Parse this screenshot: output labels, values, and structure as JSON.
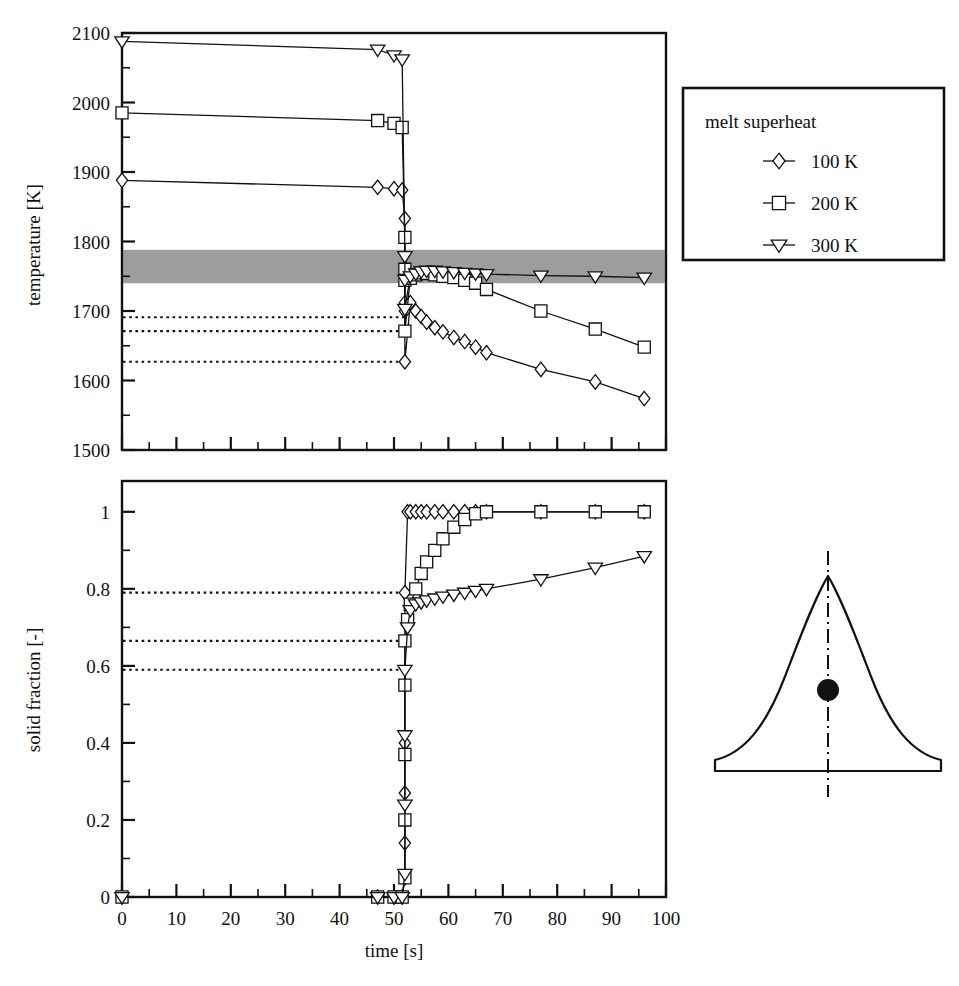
{
  "figure": {
    "background_color": "#ffffff",
    "ink_color": "#111111",
    "band_color": "#9d9d9d"
  },
  "legend": {
    "title": "melt superheat",
    "entries": [
      {
        "marker": "diamond-marker",
        "label": "100 K"
      },
      {
        "marker": "square-marker",
        "label": "200 K"
      },
      {
        "marker": "triangle-down-marker",
        "label": "300 K"
      }
    ]
  },
  "inset": {
    "name": "casting-cross-section-sketch",
    "centerline": "dash-dot-centerline",
    "probe": "thermocouple-location-dot"
  },
  "chart_data": [
    {
      "type": "line",
      "id": "temperature-vs-time",
      "title": "",
      "xlabel": "time  [s]",
      "ylabel": "temperature  [K]",
      "xlim": [
        0,
        100
      ],
      "ylim": [
        1500,
        2100
      ],
      "xticks": [
        0,
        10,
        20,
        30,
        40,
        50,
        60,
        70,
        80,
        90,
        100
      ],
      "xtick_labels": [
        "0",
        "10",
        "20",
        "30",
        "40",
        "50",
        "60",
        "70",
        "80",
        "90",
        "100"
      ],
      "yticks": [
        1500,
        1600,
        1700,
        1800,
        1900,
        2000,
        2100
      ],
      "ytick_labels": [
        "1500",
        "1600",
        "1700",
        "1800",
        "1900",
        "2000",
        "2100"
      ],
      "minor_x_step": 5,
      "minor_y_step": 50,
      "grid": false,
      "legend_position": "outside-right-top",
      "shaded_band": {
        "label": "solidification interval",
        "y_from": 1740,
        "y_to": 1788
      },
      "annotations": [
        {
          "type": "dotted-hline",
          "y": 1691,
          "x_from": 0,
          "x_to": 52,
          "belongs_to": "100 K"
        },
        {
          "type": "dotted-hline",
          "y": 1671,
          "x_from": 0,
          "x_to": 52,
          "belongs_to": "200 K"
        },
        {
          "type": "dotted-hline",
          "y": 1627,
          "x_from": 0,
          "x_to": 52,
          "belongs_to": "300 K"
        }
      ],
      "series": [
        {
          "name": "100 K",
          "marker": "diamond",
          "x": [
            0,
            47,
            50,
            51.5,
            52,
            52,
            52,
            52,
            52,
            53,
            54,
            55,
            56,
            57.5,
            59,
            61,
            63,
            65,
            67,
            77,
            87,
            96
          ],
          "y": [
            1888,
            1878,
            1876,
            1874,
            1833,
            1762,
            1712,
            1700,
            1627,
            1712,
            1700,
            1692,
            1684,
            1676,
            1670,
            1662,
            1656,
            1648,
            1640,
            1616,
            1598,
            1574
          ]
        },
        {
          "name": "200 K",
          "marker": "square",
          "x": [
            0,
            47,
            50,
            51.5,
            52,
            52,
            52,
            52,
            53,
            54,
            55,
            56,
            57.5,
            59,
            61,
            63,
            65,
            67,
            77,
            87,
            96
          ],
          "y": [
            1985,
            1974,
            1970,
            1964,
            1806,
            1760,
            1744,
            1671,
            1747,
            1752,
            1755,
            1754,
            1752,
            1750,
            1748,
            1744,
            1740,
            1731,
            1700,
            1674,
            1648
          ]
        },
        {
          "name": "300 K",
          "marker": "triangle-down",
          "x": [
            0,
            47,
            50,
            51.5,
            52,
            52,
            52,
            53,
            54,
            55,
            56,
            57.5,
            59,
            61,
            63,
            65,
            67,
            77,
            87,
            96
          ],
          "y": [
            2088,
            2076,
            2068,
            2062,
            1779,
            1745,
            1703,
            1750,
            1754,
            1757,
            1758,
            1758,
            1757,
            1756,
            1755,
            1754,
            1753,
            1751,
            1750,
            1748
          ]
        }
      ]
    },
    {
      "type": "line",
      "id": "solid-fraction-vs-time",
      "title": "",
      "xlabel": "time  [s]",
      "ylabel": "solid fraction [-]",
      "xlim": [
        0,
        100
      ],
      "ylim": [
        0,
        1.08
      ],
      "xticks": [
        0,
        10,
        20,
        30,
        40,
        50,
        60,
        70,
        80,
        90,
        100
      ],
      "xtick_labels": [
        "0",
        "10",
        "20",
        "30",
        "40",
        "50",
        "60",
        "70",
        "80",
        "90",
        "100"
      ],
      "yticks": [
        0,
        0.2,
        0.4,
        0.6,
        0.8,
        1
      ],
      "ytick_labels": [
        "0",
        "0.2",
        "0.4",
        "0.6",
        "0.8",
        "1"
      ],
      "minor_x_step": 5,
      "minor_y_step": 0.1,
      "grid": false,
      "annotations": [
        {
          "type": "dotted-hline",
          "y": 0.79,
          "x_from": 0,
          "x_to": 52,
          "belongs_to": "100 K"
        },
        {
          "type": "dotted-hline",
          "y": 0.665,
          "x_from": 0,
          "x_to": 52,
          "belongs_to": "200 K"
        },
        {
          "type": "dotted-hline",
          "y": 0.59,
          "x_from": 0,
          "x_to": 52,
          "belongs_to": "300 K"
        }
      ],
      "series": [
        {
          "name": "100 K",
          "marker": "diamond",
          "x": [
            0,
            47,
            50,
            51.5,
            52,
            52,
            52,
            52,
            52,
            52,
            52.5,
            53,
            54,
            55,
            56,
            57.5,
            59,
            61,
            63,
            65,
            67,
            77,
            87,
            96
          ],
          "y": [
            0,
            0,
            0,
            0,
            0.05,
            0.14,
            0.27,
            0.4,
            0.55,
            0.79,
            1.0,
            1.0,
            1.0,
            1.0,
            1.0,
            1.0,
            1.0,
            1.0,
            1.0,
            1.0,
            1.0,
            1.0,
            1.0,
            1.0
          ]
        },
        {
          "name": "200 K",
          "marker": "square",
          "x": [
            0,
            47,
            50,
            51.5,
            52,
            52,
            52,
            52,
            52,
            52.5,
            53,
            54,
            55,
            56,
            57.5,
            59,
            61,
            63,
            65,
            67,
            77,
            87,
            96
          ],
          "y": [
            0,
            0,
            0,
            0,
            0.05,
            0.2,
            0.37,
            0.55,
            0.665,
            0.72,
            0.76,
            0.8,
            0.84,
            0.87,
            0.9,
            0.93,
            0.96,
            0.98,
            0.995,
            1.0,
            1.0,
            1.0,
            1.0
          ]
        },
        {
          "name": "300 K",
          "marker": "triangle-down",
          "x": [
            0,
            47,
            50,
            51.5,
            52,
            52,
            52,
            52,
            52.5,
            53,
            54,
            55,
            56,
            57.5,
            59,
            61,
            63,
            65,
            67,
            77,
            87,
            96
          ],
          "y": [
            0,
            0,
            0,
            0,
            0.06,
            0.24,
            0.42,
            0.59,
            0.7,
            0.745,
            0.76,
            0.765,
            0.77,
            0.775,
            0.78,
            0.785,
            0.79,
            0.795,
            0.8,
            0.825,
            0.855,
            0.885
          ]
        }
      ]
    }
  ]
}
